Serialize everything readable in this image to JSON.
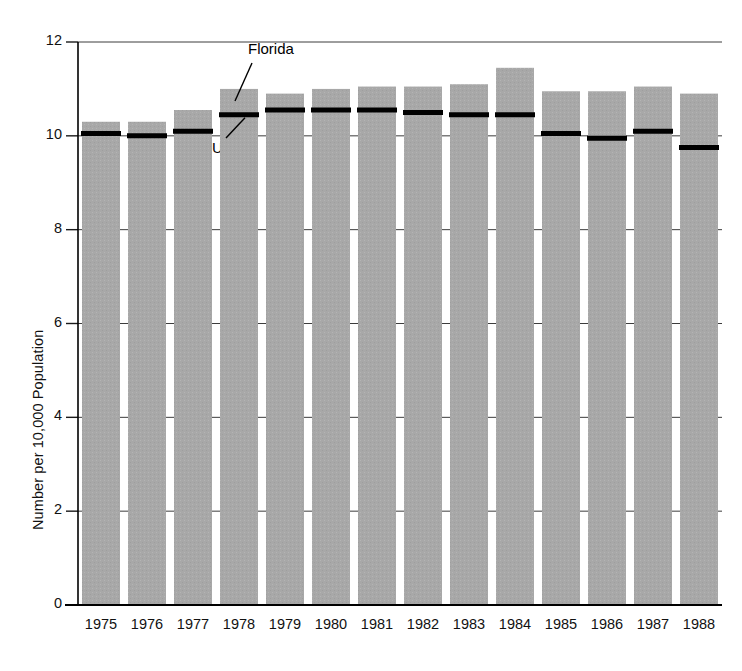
{
  "chart_data": {
    "type": "bar",
    "title": "",
    "xlabel": "",
    "ylabel": "Number per 10,000 Population",
    "categories": [
      "1975",
      "1976",
      "1977",
      "1978",
      "1979",
      "1980",
      "1981",
      "1982",
      "1983",
      "1984",
      "1985",
      "1986",
      "1987",
      "1988"
    ],
    "ylim": [
      0,
      12
    ],
    "yticks": [
      0,
      2,
      4,
      6,
      8,
      10,
      12
    ],
    "ytick_labels": [
      "0",
      "2",
      "4",
      "6",
      "8",
      "10",
      "12"
    ],
    "grid": true,
    "legend_position": "annotated-inline",
    "series": [
      {
        "name": "Florida",
        "type": "bar",
        "color": "#a8a8a8",
        "values": [
          10.3,
          10.3,
          10.55,
          11.0,
          10.9,
          11.0,
          11.05,
          11.05,
          11.1,
          11.45,
          10.95,
          10.95,
          11.05,
          10.9
        ]
      },
      {
        "name": "U.S.",
        "type": "marker-line",
        "color": "#000000",
        "values": [
          10.05,
          10.0,
          10.1,
          10.45,
          10.55,
          10.55,
          10.55,
          10.5,
          10.45,
          10.45,
          10.05,
          9.95,
          10.1,
          9.75
        ]
      }
    ],
    "annotations": [
      {
        "name": "florida-annotation",
        "label": "Florida",
        "target_series": "Florida",
        "target_category": "1978"
      },
      {
        "name": "us-annotation",
        "label": "U.S.",
        "target_series": "U.S.",
        "target_category": "1978"
      }
    ]
  }
}
